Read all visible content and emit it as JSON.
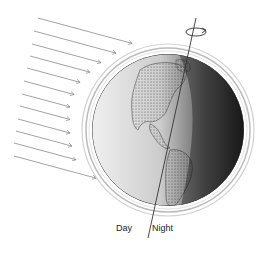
{
  "diagram": {
    "labels": {
      "day": "Day",
      "night": "Night"
    },
    "elements": {
      "sun_rays_count": 12,
      "rotation_indicator": "counter-rotation-arrow",
      "axis": "tilted-rotation-axis"
    },
    "colors": {
      "ray": "#8a8a8a",
      "globe_day": "#f2f2f2",
      "globe_night": "#2a2a2a",
      "atmosphere": "#bdbdbd",
      "land": "#9a9a9a"
    }
  }
}
